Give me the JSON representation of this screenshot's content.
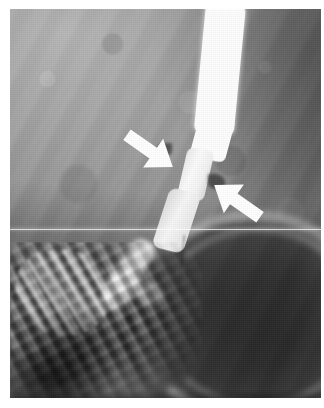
{
  "figure": {
    "modality": "barium swallow esophagram",
    "orientation": "upright lateral/oblique",
    "plate_background_hex": "#8c8c8c",
    "margin_hex": "#ffffff",
    "annotation_color_hex": "#ffffff",
    "caption": ""
  },
  "anatomy": {
    "esophagus_label": "barium-filled esophagus",
    "stricture_label": "narrowed esophageal segment",
    "egj_label": "esophagogastric junction",
    "fundus_label": "gastric fundus",
    "rugae_label": "gastric mucosal folds"
  },
  "annotations": [
    {
      "id": "arrow-upper",
      "name": "upper-left arrow",
      "direction": "down-right",
      "rotation_deg": 35,
      "color_hex": "#ffffff",
      "points_at": "upper margin of esophageal narrowing"
    },
    {
      "id": "arrow-lower",
      "name": "lower-right arrow",
      "direction": "up-left",
      "rotation_deg": 215,
      "color_hex": "#ffffff",
      "points_at": "lower margin of esophageal narrowing"
    }
  ],
  "artifacts": {
    "scanline_label": "horizontal scan line artifact",
    "scanline_y": 229
  }
}
